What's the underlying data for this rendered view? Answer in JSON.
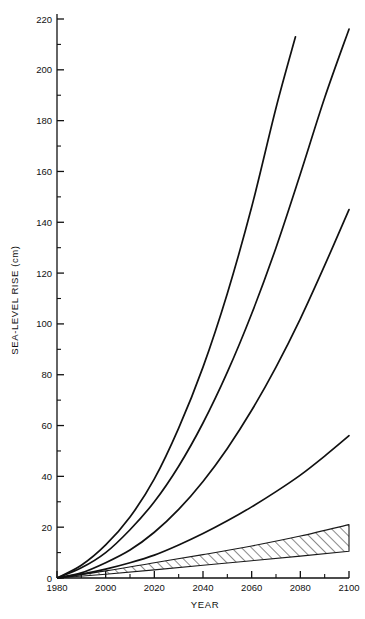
{
  "chart_data": {
    "type": "line",
    "title": "",
    "xlabel": "YEAR",
    "ylabel": "SEA-LEVEL RISE (cm)",
    "xlim": [
      1980,
      2100
    ],
    "ylim": [
      0,
      220
    ],
    "xticks": [
      1980,
      2000,
      2020,
      2040,
      2060,
      2080,
      2100
    ],
    "xtick_labels": [
      "1980",
      "2000",
      "2020",
      "2040",
      "2060",
      "2080",
      "2100"
    ],
    "yticks": [
      0,
      20,
      40,
      60,
      80,
      100,
      120,
      140,
      160,
      180,
      200,
      220
    ],
    "ytick_labels": [
      "0",
      "20",
      "40",
      "60",
      "80",
      "100",
      "120",
      "140",
      "160",
      "180",
      "200",
      "220"
    ],
    "minor_ytick_step": 10,
    "minor_xtick_step": 10,
    "grid": false,
    "legend": "none",
    "frame": "left-bottom-axis-with-inward-ticks",
    "series": [
      {
        "name": "high-scenario-upper",
        "style": "solid-line",
        "x": [
          1980,
          1990,
          2000,
          2010,
          2020,
          2030,
          2040,
          2050,
          2060,
          2070,
          2078
        ],
        "values": [
          0,
          5,
          13,
          24,
          39,
          59,
          83,
          112,
          146,
          185,
          213
        ]
      },
      {
        "name": "high-scenario-lower",
        "style": "solid-line",
        "x": [
          1980,
          1990,
          2000,
          2010,
          2020,
          2030,
          2040,
          2050,
          2060,
          2070,
          2080,
          2090,
          2100
        ],
        "values": [
          0,
          4,
          10,
          19,
          30,
          44,
          61,
          81,
          104,
          130,
          159,
          189,
          216
        ]
      },
      {
        "name": "mid-scenario",
        "style": "solid-line",
        "x": [
          1980,
          1990,
          2000,
          2010,
          2020,
          2030,
          2040,
          2050,
          2060,
          2070,
          2080,
          2090,
          2100
        ],
        "values": [
          0,
          2,
          6,
          11,
          18,
          27,
          38,
          51,
          66,
          83,
          102,
          123,
          145
        ]
      },
      {
        "name": "low-scenario",
        "style": "solid-line",
        "x": [
          1980,
          1990,
          2000,
          2010,
          2020,
          2030,
          2040,
          2050,
          2060,
          2070,
          2080,
          2090,
          2100
        ],
        "values": [
          0,
          1.5,
          3.5,
          6,
          9,
          13,
          17.5,
          22.5,
          28,
          34,
          40.5,
          48,
          56
        ]
      }
    ],
    "bands": [
      {
        "name": "hatched-uncertainty-band",
        "style": "diagonal-hatch",
        "x": [
          1980,
          2000,
          2020,
          2040,
          2060,
          2080,
          2100
        ],
        "lower": [
          0,
          1.5,
          3.2,
          5.0,
          6.8,
          8.6,
          10.5
        ],
        "upper": [
          0,
          2.8,
          6.0,
          9.2,
          12.6,
          16.5,
          21.0
        ]
      }
    ]
  }
}
